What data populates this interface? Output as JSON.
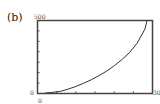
{
  "panel_label": "(b)",
  "axes": {
    "y_max_label": "500",
    "y_min_label": "0",
    "x_min_label": "0",
    "x_max_label": "30"
  },
  "chart_data": {
    "type": "line",
    "title": "",
    "panel": "(b)",
    "xlabel": "",
    "ylabel": "",
    "xlim": [
      0,
      30
    ],
    "ylim": [
      0,
      500
    ],
    "x_ticks": [
      0,
      5,
      10,
      15,
      20,
      25,
      30
    ],
    "y_ticks": [
      0,
      71,
      143,
      214,
      286,
      357,
      429,
      500
    ],
    "grid": false,
    "legend": null,
    "series": [
      {
        "name": "curve",
        "x": [
          2,
          4,
          6,
          8,
          10,
          12,
          14,
          16,
          18,
          20,
          22,
          24,
          26,
          28,
          28.6
        ],
        "values": [
          3,
          8,
          15,
          30,
          48,
          70,
          94,
          122,
          153,
          190,
          232,
          280,
          345,
          440,
          500
        ]
      }
    ]
  }
}
